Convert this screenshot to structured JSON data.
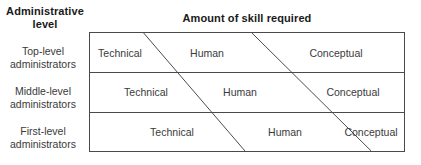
{
  "headings": {
    "row_axis": "Administrative\nlevel",
    "column_axis": "Amount of skill required"
  },
  "rows": [
    {
      "label": "Top-level\nadministrators",
      "cells": [
        "Technical",
        "Human",
        "Conceptual"
      ]
    },
    {
      "label": "Middle-level\nadministrators",
      "cells": [
        "Technical",
        "Human",
        "Conceptual"
      ]
    },
    {
      "label": "First-level\nadministrators",
      "cells": [
        "Technical",
        "Human",
        "Conceptual"
      ]
    }
  ],
  "chart_data": {
    "type": "table",
    "title": "Amount of skill required",
    "xlabel": "Amount of skill required",
    "ylabel": "Administrative level",
    "categories": [
      "Technical",
      "Human",
      "Conceptual"
    ],
    "rows": [
      "Top-level administrators",
      "Middle-level administrators",
      "First-level administrators"
    ],
    "series": [
      {
        "name": "Technical",
        "values": [
          17,
          38,
          60
        ]
      },
      {
        "name": "Human",
        "values": [
          35,
          35,
          35
        ]
      },
      {
        "name": "Conceptual",
        "values": [
          48,
          27,
          5
        ]
      }
    ],
    "units": "percent of row width",
    "grid": false,
    "legend": "none"
  },
  "geometry": {
    "box": {
      "x": 89,
      "y": 32,
      "width": 316,
      "height": 120
    },
    "dividers_y": [
      71,
      111
    ],
    "diagonal_1": {
      "x_top": 54,
      "x_bottom": 156
    },
    "diagonal_2": {
      "x_top": 163,
      "x_bottom": 283
    },
    "line_color": "#4a4a4a",
    "text_color": "#3a3a3a",
    "heading_color": "#1a1a1a",
    "background": "#ffffff"
  }
}
